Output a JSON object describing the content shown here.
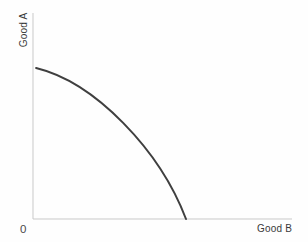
{
  "figure": {
    "y_axis_label": "Good A",
    "x_axis_label": "Good B",
    "origin_label": "0"
  },
  "chart_data": {
    "type": "line",
    "title": "",
    "xlabel": "Good B",
    "ylabel": "Good A",
    "xlim": [
      0,
      105
    ],
    "ylim": [
      0,
      105
    ],
    "x_tick_labels": [],
    "y_tick_labels": [],
    "grid": false,
    "legend": "none",
    "background": "#fefefe",
    "axis_color": "#c9c9c9",
    "series": [
      {
        "name": "production-possibilities-frontier",
        "description": "concave curve bowed outward from origin, from y-axis intercept down to x-axis intercept",
        "color": "#3f3f3f",
        "stroke_width": 2,
        "points": [
          [
            2,
            100
          ],
          [
            21,
            93
          ],
          [
            31,
            87
          ],
          [
            57,
            67
          ],
          [
            80,
            39
          ],
          [
            100,
            0
          ]
        ],
        "bezier": {
          "start": [
            2,
            100
          ],
          "control1": [
            40.5,
            90.5
          ],
          "control2": [
            83,
            45.5
          ],
          "end": [
            100,
            0
          ]
        }
      }
    ]
  }
}
